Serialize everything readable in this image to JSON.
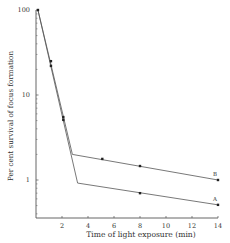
{
  "chart_data": {
    "type": "line",
    "title": "",
    "xlabel": "Time of light exposure (min)",
    "ylabel": "Per cent survival of focus formation",
    "xlim": [
      0,
      14
    ],
    "ylim": [
      0.36,
      100
    ],
    "yscale": "log",
    "x_ticks": [
      2,
      4,
      6,
      8,
      10,
      12,
      14
    ],
    "y_ticks": [
      1,
      10,
      100
    ],
    "grid": false,
    "legend": "inline labels at line ends",
    "shared_initial_segment": {
      "x": [
        0.15,
        1.15,
        1.15,
        2.1,
        2.1
      ],
      "y": [
        100,
        25,
        22,
        5.5,
        5.1
      ]
    },
    "series": [
      {
        "name": "B",
        "line": {
          "x": [
            0.15,
            2.8,
            14
          ],
          "y": [
            100,
            2.0,
            1.0
          ]
        },
        "points": {
          "x": [
            5.1,
            8,
            14
          ],
          "y": [
            1.77,
            1.46,
            1.0
          ]
        }
      },
      {
        "name": "A",
        "line": {
          "x": [
            0.15,
            3.2,
            14
          ],
          "y": [
            100,
            0.92,
            0.51
          ]
        },
        "points": {
          "x": [
            8,
            14
          ],
          "y": [
            0.7,
            0.51
          ]
        }
      }
    ],
    "colors": {
      "line": "#555555",
      "marker": "#222222",
      "text": "#333333"
    }
  }
}
